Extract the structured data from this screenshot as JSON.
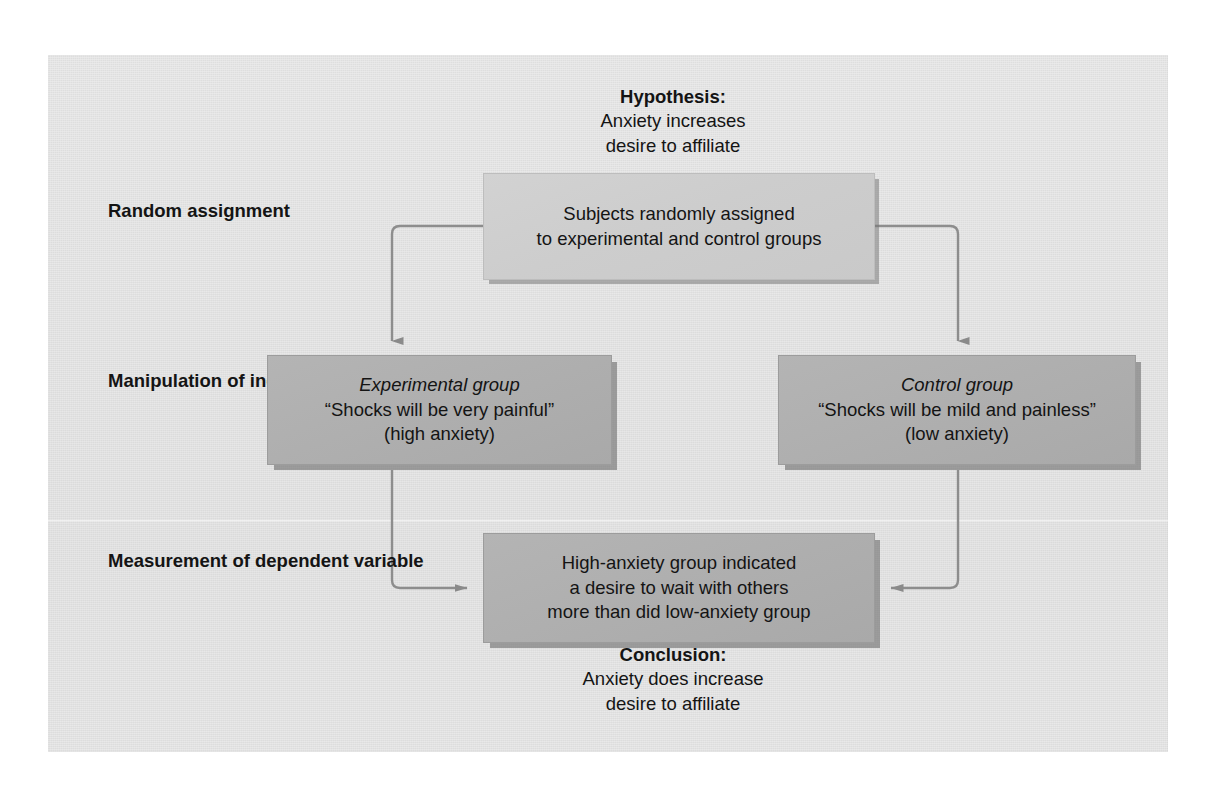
{
  "figure": {
    "hypothesis": {
      "heading": "Hypothesis:",
      "lines": [
        "Anxiety increases",
        "desire to affiliate"
      ]
    },
    "conclusion": {
      "heading": "Conclusion:",
      "lines": [
        "Anxiety does increase",
        "desire to affiliate"
      ]
    },
    "stages": [
      {
        "id": "random-assignment",
        "lines": [
          "Random",
          "assignment"
        ]
      },
      {
        "id": "manipulation-of-independent-variable",
        "lines": [
          "Manipulation of",
          "independent",
          "variable"
        ]
      },
      {
        "id": "measurement-of-dependent-variable",
        "lines": [
          "Measurement of",
          "dependent variable"
        ]
      }
    ],
    "boxes": {
      "assignment": {
        "lines": [
          "Subjects randomly assigned",
          "to experimental and control groups"
        ]
      },
      "experimental": {
        "title": "Experimental group",
        "lines": [
          "“Shocks will be very painful”",
          "(high anxiety)"
        ]
      },
      "control": {
        "title": "Control group",
        "lines": [
          "“Shocks will be mild and painless”",
          "(low anxiety)"
        ]
      },
      "result": {
        "lines": [
          "High-anxiety group indicated",
          "a desire to wait with others",
          "more than did low-anxiety group"
        ]
      }
    },
    "colors": {
      "panel_background": "#e0e0e0",
      "light_box_fill": "#cdcdcd",
      "dark_box_fill": "#afafaf",
      "connector_line": "#8d8d8d",
      "text": "#141414"
    }
  }
}
